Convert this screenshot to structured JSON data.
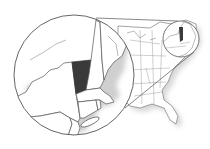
{
  "map": {
    "title": "Locator map - New England detail",
    "highlighted_state": "Vermont",
    "colors": {
      "background": "#ffffff",
      "outline": "#555555",
      "highlight": "#3a3a3a",
      "shadow": "#d8d8d8"
    },
    "magnifier": {
      "large_circle": {
        "cx": 74,
        "cy": 75,
        "r": 60
      },
      "small_circle": {
        "cx": 181,
        "cy": 39,
        "r": 18
      }
    }
  }
}
